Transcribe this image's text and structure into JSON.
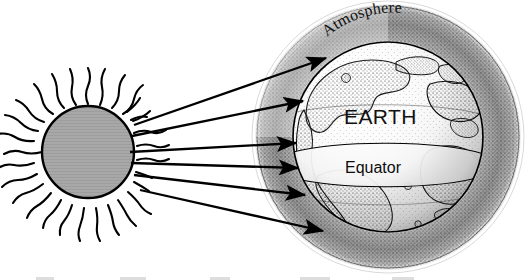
{
  "figure": {
    "kind": "science-diagram",
    "background_color": "#ffffff",
    "ink_color": "#000000"
  },
  "labels": {
    "atmosphere": "Atmosphere",
    "earth": "EARTH",
    "equator": "Equator"
  },
  "sun": {
    "name": "Sun",
    "center_x": 88,
    "center_y": 152,
    "radius": 46,
    "fill_color": "#a8a8a8",
    "outline_color": "#000000",
    "ray_count": 34,
    "ray_style": "wavy"
  },
  "earth": {
    "name": "Earth globe",
    "center_x": 388,
    "center_y": 137,
    "radius": 95,
    "fill_color": "#ffffff",
    "outline_color": "#000000",
    "stipple": true
  },
  "atmosphere": {
    "name": "Atmosphere shell",
    "center_x": 388,
    "center_y": 137,
    "inner_radius": 95,
    "outer_radius": 132,
    "halo_radius": 138,
    "stipple": true,
    "stipple_color": "#1a1a1a"
  },
  "equator_band": {
    "name": "Equator band",
    "label": "Equator",
    "fill_color": "#ffffff",
    "line_color": "#000000"
  },
  "rays": {
    "name": "Solar radiation arrows",
    "count": 6,
    "color": "#000000",
    "arrows": [
      {
        "id": "ray-1",
        "x1": 134,
        "y1": 125,
        "x2": 330,
        "y2": 57
      },
      {
        "id": "ray-2",
        "x1": 132,
        "y1": 136,
        "x2": 307,
        "y2": 100
      },
      {
        "id": "ray-3",
        "x1": 130,
        "y1": 152,
        "x2": 300,
        "y2": 143
      },
      {
        "id": "ray-4",
        "x1": 131,
        "y1": 163,
        "x2": 302,
        "y2": 168
      },
      {
        "id": "ray-5",
        "x1": 134,
        "y1": 175,
        "x2": 309,
        "y2": 195
      },
      {
        "id": "ray-6",
        "x1": 140,
        "y1": 190,
        "x2": 327,
        "y2": 232
      }
    ]
  }
}
